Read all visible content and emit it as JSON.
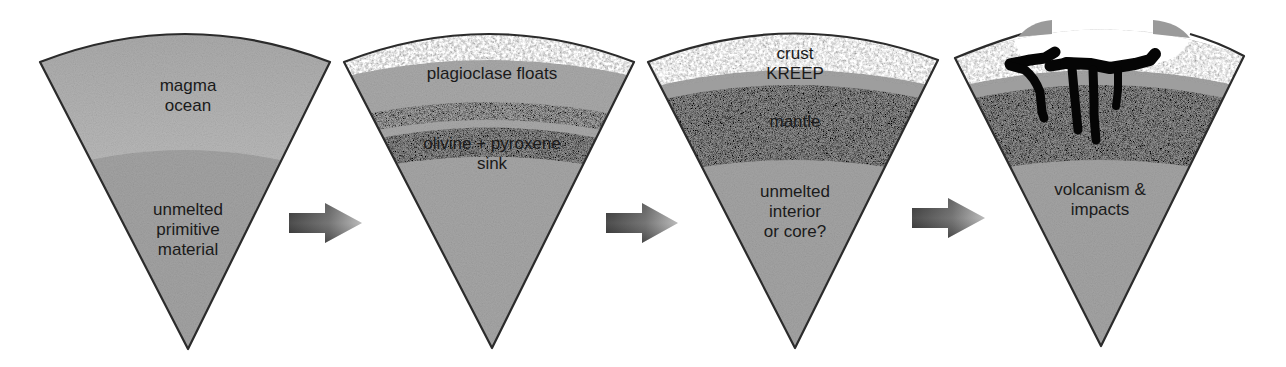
{
  "diagram": {
    "type": "process-sequence",
    "colors": {
      "outline": "#2b2b2b",
      "magma_light": "#c4c4c4",
      "magma_mid": "#a9a9a9",
      "unmelted": "#a3a3a3",
      "mantle": "#8c8c8c",
      "crust": "#dedede",
      "kreep": "#9d9d9d",
      "volcanic": "#050505",
      "arrow_dark": "#3a3a3a",
      "arrow_light": "#9a9a9a"
    },
    "stages": [
      {
        "id": "stage-1",
        "layers": [
          {
            "name": "magma-ocean",
            "label_lines": [
              "magma",
              "ocean"
            ]
          },
          {
            "name": "unmelted-primitive-material",
            "label_lines": [
              "unmelted",
              "primitive",
              "material"
            ]
          }
        ]
      },
      {
        "id": "stage-2",
        "layers": [
          {
            "name": "plagioclase-floats",
            "label_lines": [
              "plagioclase floats"
            ]
          },
          {
            "name": "olivine-pyroxene-sink",
            "label_lines": [
              "olivine + pyroxene",
              "sink"
            ]
          }
        ]
      },
      {
        "id": "stage-3",
        "layers": [
          {
            "name": "crust",
            "label_lines": [
              "crust"
            ]
          },
          {
            "name": "kreep",
            "label_lines": [
              "KREEP"
            ]
          },
          {
            "name": "mantle",
            "label_lines": [
              "mantle"
            ]
          },
          {
            "name": "unmelted-interior",
            "label_lines": [
              "unmelted",
              "interior",
              "or core?"
            ]
          }
        ]
      },
      {
        "id": "stage-4",
        "layers": [
          {
            "name": "volcanism-impacts",
            "label_lines": [
              "volcanism &",
              "impacts"
            ]
          }
        ]
      }
    ],
    "arrows": [
      {
        "from": "stage-1",
        "to": "stage-2",
        "icon": "right-arrow-icon"
      },
      {
        "from": "stage-2",
        "to": "stage-3",
        "icon": "right-arrow-icon"
      },
      {
        "from": "stage-3",
        "to": "stage-4",
        "icon": "right-arrow-icon"
      }
    ]
  }
}
